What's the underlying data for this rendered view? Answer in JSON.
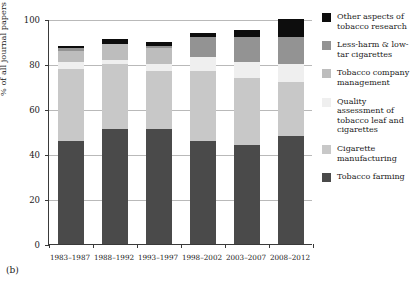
{
  "panel": {
    "tag": "(b)"
  },
  "chart_data": {
    "type": "bar",
    "stacked": true,
    "title": "",
    "xlabel": "",
    "ylabel": "% of all journal papers",
    "ylim": [
      0,
      100
    ],
    "yticks": [
      0,
      20,
      40,
      60,
      80,
      100
    ],
    "grid": true,
    "legend_position": "right",
    "categories": [
      "1983–1987",
      "1988–1992",
      "1993–1997",
      "1998–2002",
      "2003–2007",
      "2008–2012"
    ],
    "series": [
      {
        "name": "Tobacco farming",
        "color": "#4a4a4a",
        "values": [
          46,
          51,
          51,
          46,
          44,
          48
        ]
      },
      {
        "name": "Cigarette manufacturing",
        "color": "#c8c8c8",
        "values": [
          32,
          29,
          26,
          31,
          30,
          24
        ]
      },
      {
        "name": "Quality assessment of tobacco leaf and cigarettes",
        "color": "#efefef",
        "values": [
          3,
          2,
          3,
          6,
          7,
          8
        ]
      },
      {
        "name": "Tobacco company management",
        "color": "#bdbdbd",
        "values": [
          5,
          7,
          7,
          0,
          0,
          0
        ]
      },
      {
        "name": "Less-harm & low-tar cigarettes",
        "color": "#939393",
        "values": [
          1,
          0,
          1,
          9,
          11,
          12
        ]
      },
      {
        "name": "Other aspects of tobacco research",
        "color": "#0d0d0d",
        "values": [
          1,
          2,
          2,
          2,
          3,
          8
        ]
      }
    ],
    "legend_entries": [
      {
        "label": "Other aspects of tobacco research",
        "color": "#0d0d0d"
      },
      {
        "label": "Less-harm & low-tar cigarettes",
        "color": "#939393"
      },
      {
        "label": "Tobacco company management",
        "color": "#bdbdbd"
      },
      {
        "label": "Quality assessment of tobacco leaf and cigarettes",
        "color": "#efefef"
      },
      {
        "label": "Cigarette manufacturing",
        "color": "#c8c8c8"
      },
      {
        "label": "Tobacco farming",
        "color": "#4a4a4a"
      }
    ]
  }
}
